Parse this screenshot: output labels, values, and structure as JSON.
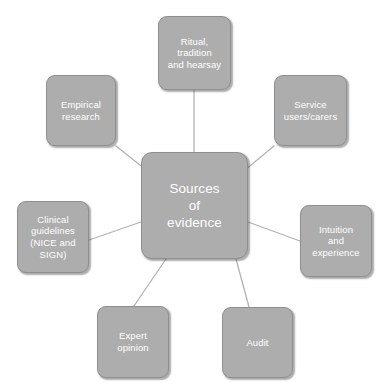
{
  "diagram": {
    "type": "hub-and-spoke",
    "title": "Sources of evidence",
    "background_color": "#ffffff",
    "node_fill_color": "#adadad",
    "node_border_color": "#8f8f8f",
    "node_text_color": "#ffffff",
    "connector_color": "#b3b3b3",
    "center": {
      "id": "center",
      "label": "Sources\nof\nevidence"
    },
    "nodes": [
      {
        "id": "ritual",
        "label": "Ritual,\ntradition\nand hearsay"
      },
      {
        "id": "empirical",
        "label": "Empirical\nresearch"
      },
      {
        "id": "service",
        "label": "Service\nusers/carers"
      },
      {
        "id": "clinical",
        "label": "Clinical\nguidelines\n(NICE and\nSIGN)"
      },
      {
        "id": "intuition",
        "label": "Intuition\nand\nexperience"
      },
      {
        "id": "expert",
        "label": "Expert\nopinion"
      },
      {
        "id": "audit",
        "label": "Audit"
      }
    ],
    "connections": [
      {
        "from": "center",
        "to": "ritual"
      },
      {
        "from": "center",
        "to": "empirical"
      },
      {
        "from": "center",
        "to": "service"
      },
      {
        "from": "center",
        "to": "clinical"
      },
      {
        "from": "center",
        "to": "intuition"
      },
      {
        "from": "center",
        "to": "expert"
      },
      {
        "from": "center",
        "to": "audit"
      }
    ]
  }
}
